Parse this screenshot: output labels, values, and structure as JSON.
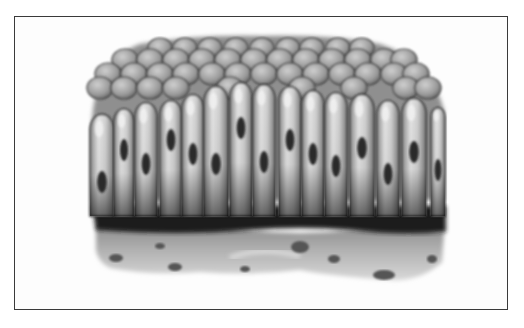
{
  "figure": {
    "alt": "Illustration of simple columnar epithelium tissue",
    "frame": {
      "x": 14,
      "y": 16,
      "width": 494,
      "height": 294,
      "border_color": "#3a3a3a"
    },
    "colors": {
      "background": "#ffffff",
      "cell_body": "#c8c8c8",
      "cell_highlight": "#ececec",
      "cell_outline": "#2e2e2e",
      "nucleus": "#2a2a2a",
      "apical_cells": "#9a9a9a",
      "basal_band": "#1e1e1e",
      "connective_tissue": "#a4a4a4",
      "connective_spots": "#555555"
    },
    "apical_rows": [
      {
        "y": 48,
        "r": 11,
        "xs": [
          160,
          185,
          210,
          236,
          262,
          288,
          312,
          338,
          362
        ]
      },
      {
        "y": 60,
        "r": 12,
        "xs": [
          125,
          150,
          176,
          202,
          228,
          254,
          280,
          306,
          332,
          358,
          384,
          404
        ]
      },
      {
        "y": 74,
        "r": 12,
        "xs": [
          108,
          134,
          160,
          186,
          212,
          238,
          264,
          290,
          316,
          342,
          368,
          394,
          416
        ]
      },
      {
        "y": 88,
        "r": 12,
        "xs": [
          100,
          124,
          150,
          176,
          230,
          302,
          354,
          406,
          428
        ]
      }
    ],
    "columnar_cells": [
      {
        "x": 102,
        "top": 118,
        "w": 24,
        "nucleus_y": 182
      },
      {
        "x": 124,
        "top": 112,
        "w": 20,
        "nucleus_y": 150
      },
      {
        "x": 146,
        "top": 106,
        "w": 22,
        "nucleus_y": 164
      },
      {
        "x": 171,
        "top": 104,
        "w": 22,
        "nucleus_y": 140
      },
      {
        "x": 193,
        "top": 98,
        "w": 22,
        "nucleus_y": 154
      },
      {
        "x": 216,
        "top": 90,
        "w": 24,
        "nucleus_y": 164
      },
      {
        "x": 241,
        "top": 86,
        "w": 22,
        "nucleus_y": 128
      },
      {
        "x": 264,
        "top": 88,
        "w": 22,
        "nucleus_y": 162
      },
      {
        "x": 290,
        "top": 90,
        "w": 22,
        "nucleus_y": 140
      },
      {
        "x": 313,
        "top": 94,
        "w": 22,
        "nucleus_y": 154
      },
      {
        "x": 336,
        "top": 96,
        "w": 22,
        "nucleus_y": 166
      },
      {
        "x": 362,
        "top": 98,
        "w": 24,
        "nucleus_y": 148
      },
      {
        "x": 388,
        "top": 104,
        "w": 22,
        "nucleus_y": 174
      },
      {
        "x": 414,
        "top": 102,
        "w": 24,
        "nucleus_y": 152
      },
      {
        "x": 438,
        "top": 110,
        "w": 14,
        "nucleus_y": 170
      }
    ],
    "basal_band": {
      "y": 206,
      "height": 26
    },
    "connective_tissue": {
      "y": 228,
      "height": 46
    },
    "connective_spots": [
      {
        "x": 116,
        "y": 258,
        "rx": 7,
        "ry": 4
      },
      {
        "x": 175,
        "y": 267,
        "rx": 7,
        "ry": 4
      },
      {
        "x": 245,
        "y": 269,
        "rx": 5,
        "ry": 3
      },
      {
        "x": 300,
        "y": 247,
        "rx": 9,
        "ry": 6
      },
      {
        "x": 334,
        "y": 259,
        "rx": 6,
        "ry": 4
      },
      {
        "x": 384,
        "y": 275,
        "rx": 11,
        "ry": 5
      },
      {
        "x": 432,
        "y": 259,
        "rx": 5,
        "ry": 4
      },
      {
        "x": 160,
        "y": 246,
        "rx": 5,
        "ry": 3
      }
    ]
  }
}
